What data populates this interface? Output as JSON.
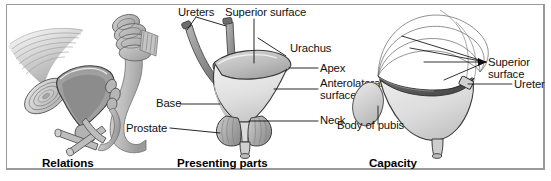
{
  "figure": {
    "background_color": "#ffffff",
    "border_color": "#9a9a9a"
  },
  "panels": [
    {
      "id": "relations",
      "caption": "Relations",
      "labels": []
    },
    {
      "id": "presenting-parts",
      "caption": "Presenting parts",
      "labels": [
        {
          "name": "ureters",
          "text": "Ureters"
        },
        {
          "name": "superior-surface",
          "text": "Superior surface"
        },
        {
          "name": "urachus",
          "text": "Urachus"
        },
        {
          "name": "apex",
          "text": "Apex"
        },
        {
          "name": "anterolateral-surface",
          "text": "Anterolateral surface"
        },
        {
          "name": "neck",
          "text": "Neck"
        },
        {
          "name": "base",
          "text": "Base"
        },
        {
          "name": "prostate",
          "text": "Prostate"
        }
      ]
    },
    {
      "id": "capacity",
      "caption": "Capacity",
      "labels": [
        {
          "name": "superior-surface",
          "text": "Superior surface"
        },
        {
          "name": "ureter",
          "text": "Ureter"
        },
        {
          "name": "body-of-pubis",
          "text": "Body of pubis"
        }
      ]
    }
  ],
  "label_text": {
    "ureters": "Ureters",
    "superior_surface": "Superior surface",
    "urachus": "Urachus",
    "apex": "Apex",
    "anterolateral_surface_line1": "Anterolateral",
    "anterolateral_surface_line2": "surface",
    "neck": "Neck",
    "base": "Base",
    "prostate": "Prostate",
    "body_of_pubis": "Body of pubis",
    "cap_superior_line1": "Superior",
    "cap_superior_line2": "surface",
    "ureter": "Ureter"
  },
  "captions": {
    "relations": "Relations",
    "presenting_parts": "Presenting parts",
    "capacity": "Capacity"
  },
  "colors": {
    "ink": "#111111",
    "line": "#1a1a1a",
    "fill_light": "#e8e8e8",
    "fill_mid": "#c9c9c9",
    "fill_dark": "#8f8f8f",
    "fill_darker": "#5e5e5e"
  }
}
